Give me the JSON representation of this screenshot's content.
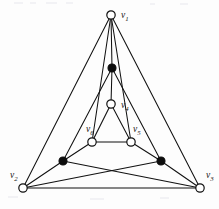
{
  "figure": {
    "background_color": "#fdfdfd",
    "line_color": "#111111",
    "open_vertex_fill": "#ffffff",
    "filled_vertex_fill": "#0d0d0d",
    "width": 219,
    "height": 209
  },
  "vertices": [
    {
      "id": "v1",
      "label": "v",
      "sub": "1",
      "x": 111,
      "y": 15,
      "style": "open",
      "label_x": 121,
      "label_y": 16,
      "labeled": true
    },
    {
      "id": "a1",
      "label": "",
      "sub": "",
      "x": 112,
      "y": 68,
      "style": "filled",
      "label_x": 0,
      "label_y": 0,
      "labeled": false
    },
    {
      "id": "v4",
      "label": "v",
      "sub": "4",
      "x": 111,
      "y": 104,
      "style": "open",
      "label_x": 121,
      "label_y": 106,
      "labeled": true
    },
    {
      "id": "v6",
      "label": "v",
      "sub": "6",
      "x": 92,
      "y": 142,
      "style": "open",
      "label_x": 86,
      "label_y": 130,
      "labeled": true
    },
    {
      "id": "v5",
      "label": "v",
      "sub": "5",
      "x": 131,
      "y": 142,
      "style": "open",
      "label_x": 133,
      "label_y": 130,
      "labeled": true
    },
    {
      "id": "a2",
      "label": "",
      "sub": "",
      "x": 63,
      "y": 161,
      "style": "filled",
      "label_x": 0,
      "label_y": 0,
      "labeled": false
    },
    {
      "id": "a3",
      "label": "",
      "sub": "",
      "x": 161,
      "y": 161,
      "style": "filled",
      "label_x": 0,
      "label_y": 0,
      "labeled": false
    },
    {
      "id": "v2",
      "label": "v",
      "sub": "2",
      "x": 23,
      "y": 188,
      "style": "open",
      "label_x": 10,
      "label_y": 176,
      "labeled": true
    },
    {
      "id": "v3",
      "label": "v",
      "sub": "3",
      "x": 200,
      "y": 188,
      "style": "open",
      "label_x": 206,
      "label_y": 176,
      "labeled": true
    }
  ],
  "edges": [
    {
      "from": "v1",
      "to": "a1"
    },
    {
      "from": "v1",
      "to": "v2"
    },
    {
      "from": "v1",
      "to": "v3"
    },
    {
      "from": "v1",
      "to": "v6"
    },
    {
      "from": "v1",
      "to": "v5"
    },
    {
      "from": "a1",
      "to": "v4"
    },
    {
      "from": "a1",
      "to": "a2"
    },
    {
      "from": "a1",
      "to": "a3"
    },
    {
      "from": "v4",
      "to": "v6"
    },
    {
      "from": "v4",
      "to": "v5"
    },
    {
      "from": "v6",
      "to": "v5"
    },
    {
      "from": "v6",
      "to": "a2"
    },
    {
      "from": "v5",
      "to": "a3"
    },
    {
      "from": "a2",
      "to": "v2"
    },
    {
      "from": "a3",
      "to": "v3"
    },
    {
      "from": "a2",
      "to": "v3"
    },
    {
      "from": "a3",
      "to": "v2"
    },
    {
      "from": "v2",
      "to": "v3"
    }
  ],
  "geometry": {
    "open_radius": 4.2,
    "filled_radius": 4.0
  }
}
